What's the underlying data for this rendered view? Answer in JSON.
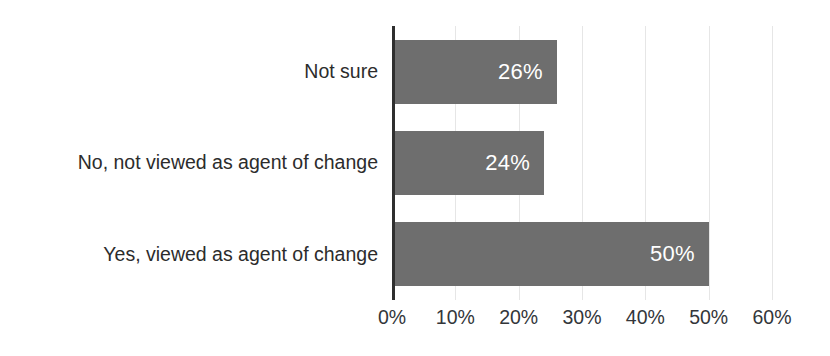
{
  "chart_data": {
    "type": "bar",
    "orientation": "horizontal",
    "title": "",
    "subtitle": "",
    "xlabel": "",
    "ylabel": "",
    "categories": [
      "Yes, viewed as agent of change",
      "No, not viewed as agent of change",
      "Not sure"
    ],
    "values": [
      50,
      24,
      26
    ],
    "value_labels": [
      "50%",
      "24%",
      "26%"
    ],
    "xlim": [
      0,
      60
    ],
    "x_ticks": [
      0,
      10,
      20,
      30,
      40,
      50,
      60
    ],
    "x_tick_labels": [
      "0%",
      "10%",
      "20%",
      "30%",
      "40%",
      "50%",
      "60%"
    ],
    "grid": true,
    "grid_axis": "x",
    "legend": false,
    "legend_position": "none",
    "bar_color": "#6e6e6e",
    "value_label_color": "#ffffff",
    "axis_line_color": "#2f2f2f",
    "gridline_color": "#e6e6e6",
    "tick_label_color": "#33363a",
    "category_label_color": "#2c2c2c",
    "background_color": "#ffffff"
  }
}
